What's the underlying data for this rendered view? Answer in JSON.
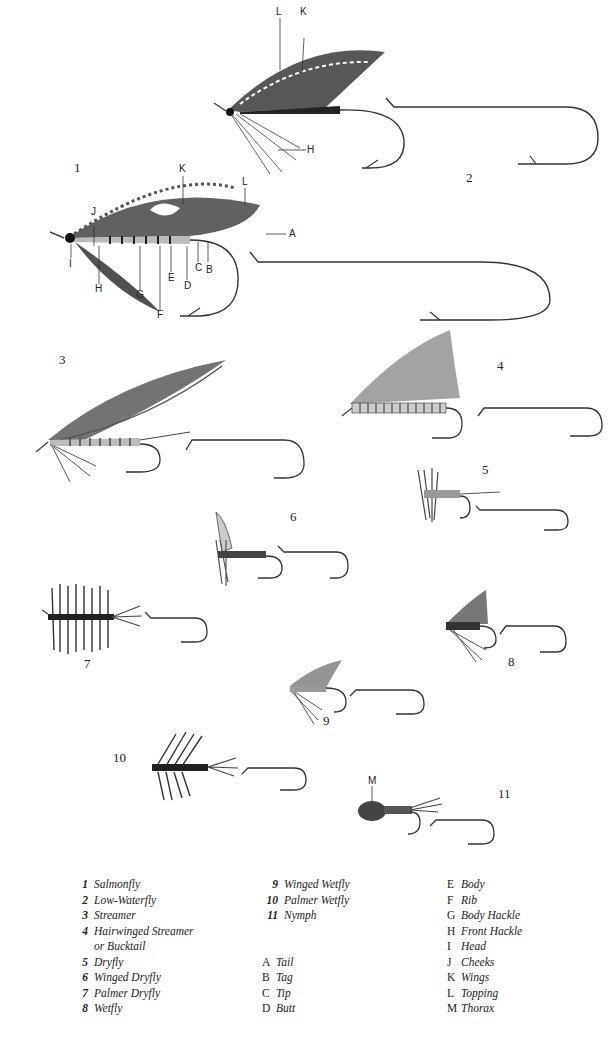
{
  "plate": {
    "figures": [
      {
        "id": 1,
        "label": "1",
        "name": "Salmonfly",
        "x": 74,
        "y": 166
      },
      {
        "id": 2,
        "label": "2",
        "name": "Low-Waterfly",
        "x": 466,
        "y": 176
      },
      {
        "id": 3,
        "label": "3",
        "name": "Streamer",
        "x": 59,
        "y": 358
      },
      {
        "id": 4,
        "label": "4",
        "name": "Hairwinged Streamer or Bucktail",
        "x": 497,
        "y": 364
      },
      {
        "id": 5,
        "label": "5",
        "name": "Dryfly",
        "x": 482,
        "y": 468
      },
      {
        "id": 6,
        "label": "6",
        "name": "Winged Dryfly",
        "x": 290,
        "y": 515
      },
      {
        "id": 7,
        "label": "7",
        "name": "Palmer Dryfly",
        "x": 84,
        "y": 662
      },
      {
        "id": 8,
        "label": "8",
        "name": "Wetfly",
        "x": 508,
        "y": 660
      },
      {
        "id": 9,
        "label": "9",
        "name": "Winged Wetfly",
        "x": 323,
        "y": 719
      },
      {
        "id": 10,
        "label": "10",
        "name": "Palmer Wetfly",
        "x": 113,
        "y": 756
      },
      {
        "id": 11,
        "label": "11",
        "name": "Nymph",
        "x": 498,
        "y": 792
      }
    ],
    "part_callouts": {
      "fig1": [
        "K",
        "L",
        "J",
        "A",
        "I",
        "H",
        "G",
        "F",
        "E",
        "D",
        "C",
        "B"
      ],
      "fig2": [
        "L",
        "K",
        "H"
      ],
      "fig11": [
        "M"
      ]
    }
  },
  "legend": {
    "flies": [
      {
        "num": "1",
        "text": "Salmonfly"
      },
      {
        "num": "2",
        "text": "Low-Waterfly"
      },
      {
        "num": "3",
        "text": "Streamer"
      },
      {
        "num": "4",
        "text": "Hairwinged Streamer"
      },
      {
        "num": "",
        "text": "or Bucktail"
      },
      {
        "num": "5",
        "text": "Dryfly"
      },
      {
        "num": "6",
        "text": "Winged Dryfly"
      },
      {
        "num": "7",
        "text": "Palmer Dryfly"
      },
      {
        "num": "8",
        "text": "Wetfly"
      },
      {
        "num": "9",
        "text": "Winged Wetfly"
      },
      {
        "num": "10",
        "text": "Palmer Wetfly"
      },
      {
        "num": "11",
        "text": "Nymph"
      }
    ],
    "parts": [
      {
        "letter": "A",
        "text": "Tail"
      },
      {
        "letter": "B",
        "text": "Tag"
      },
      {
        "letter": "C",
        "text": "Tip"
      },
      {
        "letter": "D",
        "text": "Butt"
      },
      {
        "letter": "E",
        "text": "Body"
      },
      {
        "letter": "F",
        "text": "Rib"
      },
      {
        "letter": "G",
        "text": "Body Hackle"
      },
      {
        "letter": "H",
        "text": "Front Hackle"
      },
      {
        "letter": "I",
        "text": "Head"
      },
      {
        "letter": "J",
        "text": "Cheeks"
      },
      {
        "letter": "K",
        "text": "Wings"
      },
      {
        "letter": "L",
        "text": "Topping"
      },
      {
        "letter": "M",
        "text": "Thorax"
      }
    ]
  }
}
